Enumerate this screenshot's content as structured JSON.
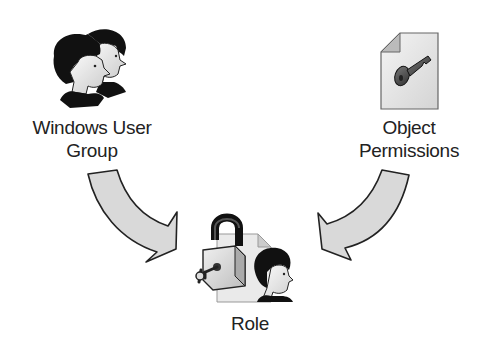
{
  "diagram": {
    "nodes": [
      {
        "id": "windows-user-group",
        "label_line1": "Windows User",
        "label_line2": "Group",
        "icon": "user-group-icon"
      },
      {
        "id": "object-permissions",
        "label_line1": "Object",
        "label_line2": "Permissions",
        "icon": "key-document-icon"
      },
      {
        "id": "role",
        "label": "Role",
        "icon": "role-lock-user-icon"
      }
    ],
    "edges": [
      {
        "from": "windows-user-group",
        "to": "role",
        "style": "curved-block-arrow"
      },
      {
        "from": "object-permissions",
        "to": "role",
        "style": "curved-block-arrow"
      }
    ],
    "colors": {
      "arrow_fill": "#d9d9d9",
      "outline": "#222222",
      "hair": "#111111",
      "face": "#eeeeee"
    }
  }
}
